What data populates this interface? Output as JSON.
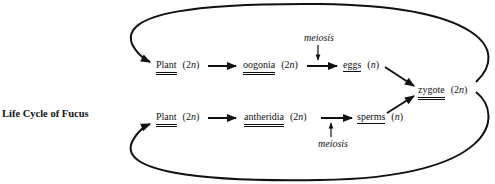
{
  "title": "Life Cycle of Fucus",
  "nodes": {
    "plant_top": {
      "label": "Plant",
      "ploidy_num": "2",
      "ploidy_var": "n"
    },
    "oogonia": {
      "label": "oogonia",
      "ploidy_num": "2",
      "ploidy_var": "n"
    },
    "eggs": {
      "label": "eggs",
      "ploidy_num": "",
      "ploidy_var": "n"
    },
    "zygote": {
      "label": "zygote",
      "ploidy_num": "2",
      "ploidy_var": "n"
    },
    "plant_bottom": {
      "label": "Plant",
      "ploidy_num": "2",
      "ploidy_var": "n"
    },
    "antheridia": {
      "label": "antheridia",
      "ploidy_num": "2",
      "ploidy_var": "n"
    },
    "sperms": {
      "label": "sperms",
      "ploidy_num": "",
      "ploidy_var": "n"
    }
  },
  "annotations": {
    "meiosis_top": "meiosis",
    "meiosis_bottom": "meiosis"
  },
  "edges": [
    {
      "from": "plant_top",
      "to": "oogonia"
    },
    {
      "from": "oogonia",
      "to": "eggs",
      "label": "meiosis"
    },
    {
      "from": "eggs",
      "to": "zygote"
    },
    {
      "from": "plant_bottom",
      "to": "antheridia"
    },
    {
      "from": "antheridia",
      "to": "sperms",
      "label": "meiosis"
    },
    {
      "from": "sperms",
      "to": "zygote"
    },
    {
      "from": "zygote",
      "to": "plant_top",
      "style": "loop"
    },
    {
      "from": "zygote",
      "to": "plant_bottom",
      "style": "loop"
    }
  ]
}
